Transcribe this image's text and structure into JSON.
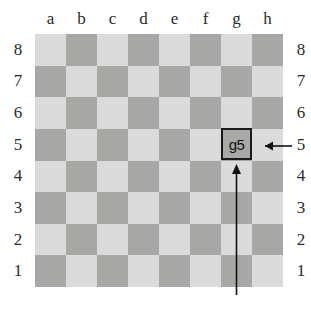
{
  "figure": {
    "kind": "chessboard-coordinate-diagram",
    "highlight_square": "g5"
  },
  "board": {
    "files": [
      "a",
      "b",
      "c",
      "d",
      "e",
      "f",
      "g",
      "h"
    ],
    "ranks": [
      "8",
      "7",
      "6",
      "5",
      "4",
      "3",
      "2",
      "1"
    ],
    "light_color": "#dededd",
    "dark_color": "#a9a9a8",
    "top_left_square_shade": "light",
    "squares": [
      [
        "light",
        "dark",
        "light",
        "dark",
        "light",
        "dark",
        "light",
        "dark"
      ],
      [
        "dark",
        "light",
        "dark",
        "light",
        "dark",
        "light",
        "dark",
        "light"
      ],
      [
        "light",
        "dark",
        "light",
        "dark",
        "light",
        "dark",
        "light",
        "dark"
      ],
      [
        "dark",
        "light",
        "dark",
        "light",
        "dark",
        "light",
        "dark",
        "light"
      ],
      [
        "light",
        "dark",
        "light",
        "dark",
        "light",
        "dark",
        "light",
        "dark"
      ],
      [
        "dark",
        "light",
        "dark",
        "light",
        "dark",
        "light",
        "dark",
        "light"
      ],
      [
        "light",
        "dark",
        "light",
        "dark",
        "light",
        "dark",
        "light",
        "dark"
      ],
      [
        "dark",
        "light",
        "dark",
        "light",
        "dark",
        "light",
        "dark",
        "light"
      ]
    ]
  },
  "coord_box": {
    "label": "g5",
    "file": "g",
    "rank": "5",
    "border_color": "#1a1a1a",
    "fill_color": "#a9a9a8"
  },
  "annotations": {
    "rank_arrow": {
      "name": "rank-arrow",
      "direction": "left",
      "points_to": "g5",
      "originates_from_label": "5",
      "color": "#111111"
    },
    "file_arrow": {
      "name": "file-arrow",
      "direction": "up",
      "points_to": "g5",
      "originates_from_label": "g",
      "color": "#111111"
    }
  }
}
